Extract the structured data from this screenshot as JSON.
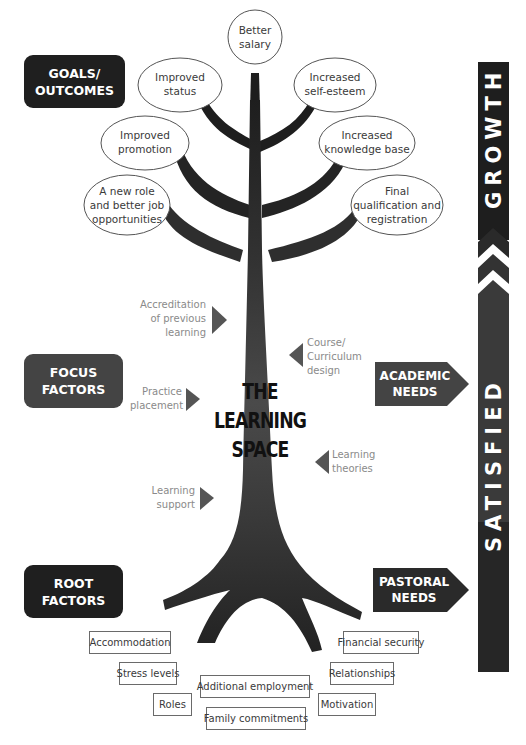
{
  "diagram": {
    "center_title": [
      "THE",
      "LEARNING",
      "SPACE"
    ],
    "categories": {
      "goals": [
        "GOALS/",
        "OUTCOMES"
      ],
      "focus": [
        "FOCUS",
        "FACTORS"
      ],
      "root": [
        "ROOT",
        "FACTORS"
      ]
    },
    "needs": {
      "academic": [
        "ACADEMIC",
        "NEEDS"
      ],
      "pastoral": [
        "PASTORAL",
        "NEEDS"
      ]
    },
    "vertical_bar": {
      "top_word": "GROWTH",
      "bottom_word": "SATISFIED",
      "separator_icon": "double-chevron-up"
    },
    "goals_ellipses": [
      {
        "lines": [
          "Better",
          "salary"
        ]
      },
      {
        "lines": [
          "Improved",
          "status"
        ]
      },
      {
        "lines": [
          "Increased",
          "self-esteem"
        ]
      },
      {
        "lines": [
          "Improved",
          "promotion"
        ]
      },
      {
        "lines": [
          "Increased",
          "knowledge base"
        ]
      },
      {
        "lines": [
          "A new role",
          "and better job",
          "opportunities"
        ]
      },
      {
        "lines": [
          "Final",
          "qualification and",
          "registration"
        ]
      }
    ],
    "focus_factors": [
      {
        "lines": [
          "Accreditation",
          "of previous",
          "learning"
        ],
        "arrow": "right"
      },
      {
        "lines": [
          "Course/",
          "Curriculum",
          "design"
        ],
        "arrow": "left"
      },
      {
        "lines": [
          "Practice",
          "placement"
        ],
        "arrow": "right"
      },
      {
        "lines": [
          "Learning",
          "theories"
        ],
        "arrow": "left"
      },
      {
        "lines": [
          "Learning",
          "support"
        ],
        "arrow": "right"
      }
    ],
    "root_factors": [
      "Accommodation",
      "Financial security",
      "Stress levels",
      "Relationships",
      "Additional employment",
      "Roles",
      "Motivation",
      "Family commitments"
    ],
    "colors": {
      "dark_box": "#1f1f1f",
      "mid_box": "#444444",
      "tree": "#2b2b2b",
      "trunk_mid": "#4a4a4a",
      "arrow_grey": "#555555",
      "focus_text": "#8a8a8a"
    }
  }
}
